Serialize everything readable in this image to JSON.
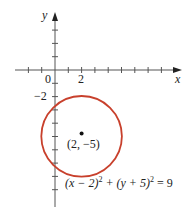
{
  "diagram": {
    "axes": {
      "x_label": "x",
      "y_label": "y",
      "origin_label": "0",
      "x_tick_label": "2",
      "y_tick_label": "−2"
    },
    "circle": {
      "center": [
        2,
        -5
      ],
      "radius": 3,
      "color": "#c8402c"
    },
    "center_label": "(2, −5)",
    "equation": {
      "part1": "(x − 2)",
      "exp1": "2",
      "part2": " + (y + 5)",
      "exp2": "2",
      "part3": " = 9"
    }
  }
}
